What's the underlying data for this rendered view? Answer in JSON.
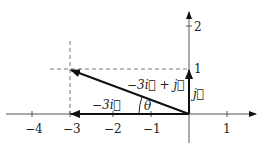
{
  "diagram": {
    "type": "vector-decomposition",
    "axes": {
      "x_ticks": [
        "−4",
        "−3",
        "−2",
        "−1",
        "1"
      ],
      "y_ticks": [
        "1",
        "2"
      ]
    },
    "vectors": [
      {
        "name": "resultant",
        "label": "−3i⃗ + j⃗",
        "from": [
          0,
          0
        ],
        "to": [
          -3,
          1
        ]
      },
      {
        "name": "horizontal",
        "label": "−3i⃗",
        "from": [
          0,
          0
        ],
        "to": [
          -3,
          0
        ]
      },
      {
        "name": "vertical",
        "label": "j⃗",
        "from": [
          0,
          0
        ],
        "to": [
          0,
          1
        ]
      }
    ],
    "angle_label": "θ",
    "guides": "dashed lines at x = −3 and y = 1",
    "colors": {
      "axis": "#555555",
      "vector": "#111111",
      "dashed": "#777777"
    }
  }
}
